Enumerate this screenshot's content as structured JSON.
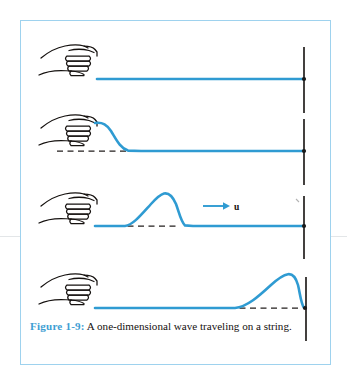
{
  "figure": {
    "caption_label": "Figure 1-9:",
    "caption_text": "A one-dimensional wave traveling on a string.",
    "velocity_label": "u",
    "accent_color": "#3e9ed3",
    "string_color": "#2f9bd2",
    "border_color": "#9ed2ee",
    "ink_color": "#15110f",
    "panels": [
      {
        "name": "panel-flat-string",
        "description": "Straight horizontal string held by a hand at the left and tied to a post at the right",
        "baseline_y": 58,
        "pulse_peak_x": null,
        "pulse_height": 0,
        "has_dashed_baseline": false
      },
      {
        "name": "panel-pulse-at-hand",
        "description": "Hand has flicked upward creating a pulse crest right at the hand",
        "baseline_y": 130,
        "pulse_peak_x": 96,
        "pulse_height": 28,
        "has_dashed_baseline": true
      },
      {
        "name": "panel-pulse-midway",
        "description": "Pulse has traveled to the middle of the string, moving right with velocity u",
        "baseline_y": 205,
        "pulse_peak_x": 160,
        "pulse_height": 35,
        "has_dashed_baseline": true
      },
      {
        "name": "panel-pulse-at-wall",
        "description": "Pulse has reached the post at the right end of the string",
        "baseline_y": 287,
        "pulse_peak_x": 270,
        "pulse_height": 34,
        "has_dashed_baseline": true
      }
    ]
  }
}
